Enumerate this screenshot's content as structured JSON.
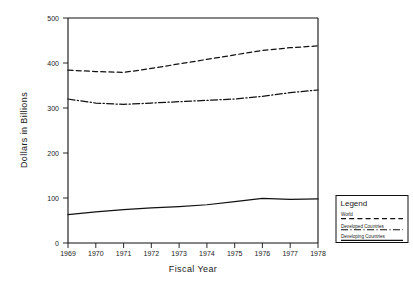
{
  "chart_data": {
    "type": "line",
    "title": "",
    "xlabel": "Fiscal Year",
    "ylabel": "Dollars in Billions",
    "grid": false,
    "legend_position": "bottom-right-outside",
    "legend_title": "Legend",
    "categories": [
      "1969",
      "1970",
      "1971",
      "1972",
      "1973",
      "1974",
      "1975",
      "1976",
      "1977",
      "1978"
    ],
    "x": [
      1969,
      1970,
      1971,
      1972,
      1973,
      1974,
      1975,
      1976,
      1977,
      1978
    ],
    "xlim": [
      1969,
      1978
    ],
    "ylim": [
      0,
      500
    ],
    "yticks": [
      0,
      100,
      200,
      300,
      400,
      500
    ],
    "ytick_labels": [
      "0",
      "100",
      "200",
      "300",
      "400",
      "500"
    ],
    "series": [
      {
        "name": "World",
        "style": "dashed",
        "color": "#111111",
        "values": [
          384,
          381,
          379,
          388,
          398,
          408,
          418,
          428,
          434,
          438
        ]
      },
      {
        "name": "Developed Countries",
        "style": "dash-dot",
        "color": "#111111",
        "values": [
          320,
          311,
          308,
          311,
          314,
          317,
          320,
          326,
          334,
          340
        ]
      },
      {
        "name": "Developing Countries",
        "style": "solid",
        "color": "#111111",
        "values": [
          63,
          69,
          74,
          78,
          81,
          85,
          92,
          99,
          97,
          98
        ]
      }
    ]
  }
}
